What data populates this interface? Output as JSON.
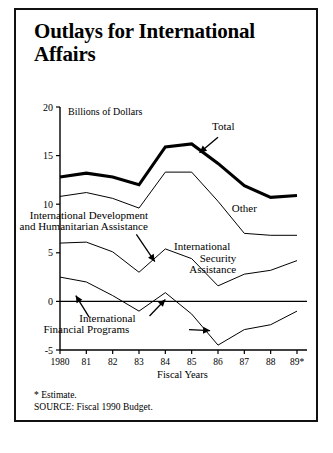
{
  "figure": {
    "title": "Outlays for International Affairs",
    "note_estimate": "* Estimate.",
    "note_source": "SOURCE: Fiscal 1990 Budget."
  },
  "chart_data": {
    "type": "line",
    "title": "Outlays for International Affairs",
    "unit_label": "Billions of Dollars",
    "xlabel": "Fiscal Years",
    "ylabel": "",
    "x": [
      1980,
      1981,
      1982,
      1983,
      1984,
      1985,
      1986,
      1987,
      1988,
      1989
    ],
    "categories": [
      "1980",
      "81",
      "82",
      "83",
      "84",
      "85",
      "86",
      "87",
      "88",
      "89*"
    ],
    "ylim": [
      -5,
      20
    ],
    "yticks": [
      -5,
      0,
      5,
      10,
      15,
      20
    ],
    "ytick_labels": [
      "-5",
      "0",
      "5",
      "10",
      "15",
      "20"
    ],
    "grid": false,
    "legend": "inline-annotations",
    "series": [
      {
        "name": "Total",
        "style": "thick",
        "values": [
          12.8,
          13.2,
          12.8,
          12.0,
          15.9,
          16.2,
          14.2,
          11.9,
          10.7,
          10.9
        ]
      },
      {
        "name": "Other",
        "style": "thin",
        "values": [
          10.8,
          11.2,
          10.6,
          9.6,
          13.3,
          13.3,
          10.3,
          7.0,
          6.8,
          6.8
        ]
      },
      {
        "name": "International Development and Humanitarian Assistance",
        "style": "thin",
        "values": [
          6.0,
          6.1,
          5.1,
          3.0,
          5.4,
          4.4,
          1.6,
          2.8,
          3.2,
          4.2
        ]
      },
      {
        "name": "International Security Assistance",
        "style": "thin",
        "values": [
          2.5,
          2.0,
          0.6,
          -1.0,
          0.9,
          -1.3,
          -4.5,
          -2.9,
          -2.4,
          -1.0
        ]
      }
    ],
    "annotations": [
      {
        "text": "Total",
        "x": 1986.2,
        "y": 17.6
      },
      {
        "text": "Other",
        "x": 1987.0,
        "y": 9.2
      },
      {
        "text": "International Development",
        "x": 1981.1,
        "y": 8.5
      },
      {
        "text": "and Humanitarian Assistance",
        "x": 1980.9,
        "y": 7.3
      },
      {
        "text": "International",
        "x": 1985.4,
        "y": 5.3
      },
      {
        "text": "Security",
        "x": 1986.0,
        "y": 4.1
      },
      {
        "text": "Assistance",
        "x": 1985.8,
        "y": 2.9
      },
      {
        "text": "International",
        "x": 1981.8,
        "y": -2.1
      },
      {
        "text": "Financial Programs",
        "x": 1981.0,
        "y": -3.3
      }
    ]
  }
}
